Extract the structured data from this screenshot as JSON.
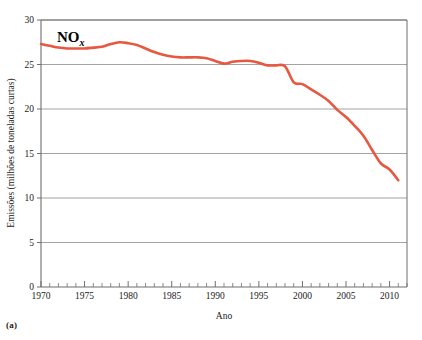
{
  "figure": {
    "panel_caption": "(a)",
    "series_label_main": "NO",
    "series_label_sub": "x"
  },
  "chart_data": {
    "type": "line",
    "title": "",
    "subtitle": "",
    "xlabel": "Ano",
    "ylabel": "Emissões (milhões de toneladas curtas)",
    "xlim": [
      1970,
      2012
    ],
    "ylim": [
      0,
      30
    ],
    "grid": "horizontal",
    "legend_position": "none",
    "annotations": [
      {
        "text": "NOx",
        "x": 1973,
        "y": 28.6
      }
    ],
    "xticks": [
      1970,
      1975,
      1980,
      1985,
      1990,
      1995,
      2000,
      2005,
      2010
    ],
    "xtick_labels": [
      "1970",
      "1975",
      "1980",
      "1985",
      "1990",
      "1995",
      "2000",
      "2005",
      "2010"
    ],
    "xminor_tick_step": 1,
    "yticks": [
      0,
      5,
      10,
      15,
      20,
      25,
      30
    ],
    "ytick_labels": [
      "0",
      "5",
      "10",
      "15",
      "20",
      "25",
      "30"
    ],
    "series": [
      {
        "name": "NOx",
        "color": "#E8573F",
        "x": [
          1970,
          1971,
          1972,
          1973,
          1974,
          1975,
          1976,
          1977,
          1978,
          1979,
          1980,
          1981,
          1982,
          1983,
          1984,
          1985,
          1986,
          1987,
          1988,
          1989,
          1990,
          1991,
          1992,
          1993,
          1994,
          1995,
          1996,
          1997,
          1998,
          1999,
          2000,
          2001,
          2002,
          2003,
          2004,
          2005,
          2006,
          2007,
          2008,
          2009,
          2010,
          2011
        ],
        "values": [
          27.3,
          27.1,
          26.9,
          26.8,
          26.8,
          26.8,
          26.9,
          27.0,
          27.3,
          27.5,
          27.4,
          27.2,
          26.8,
          26.4,
          26.1,
          25.9,
          25.8,
          25.8,
          25.8,
          25.7,
          25.4,
          25.1,
          25.3,
          25.4,
          25.4,
          25.2,
          24.9,
          24.9,
          24.8,
          23.0,
          22.8,
          22.2,
          21.6,
          20.9,
          19.9,
          19.1,
          18.1,
          17.0,
          15.4,
          13.9,
          13.2,
          12.0
        ]
      }
    ]
  }
}
